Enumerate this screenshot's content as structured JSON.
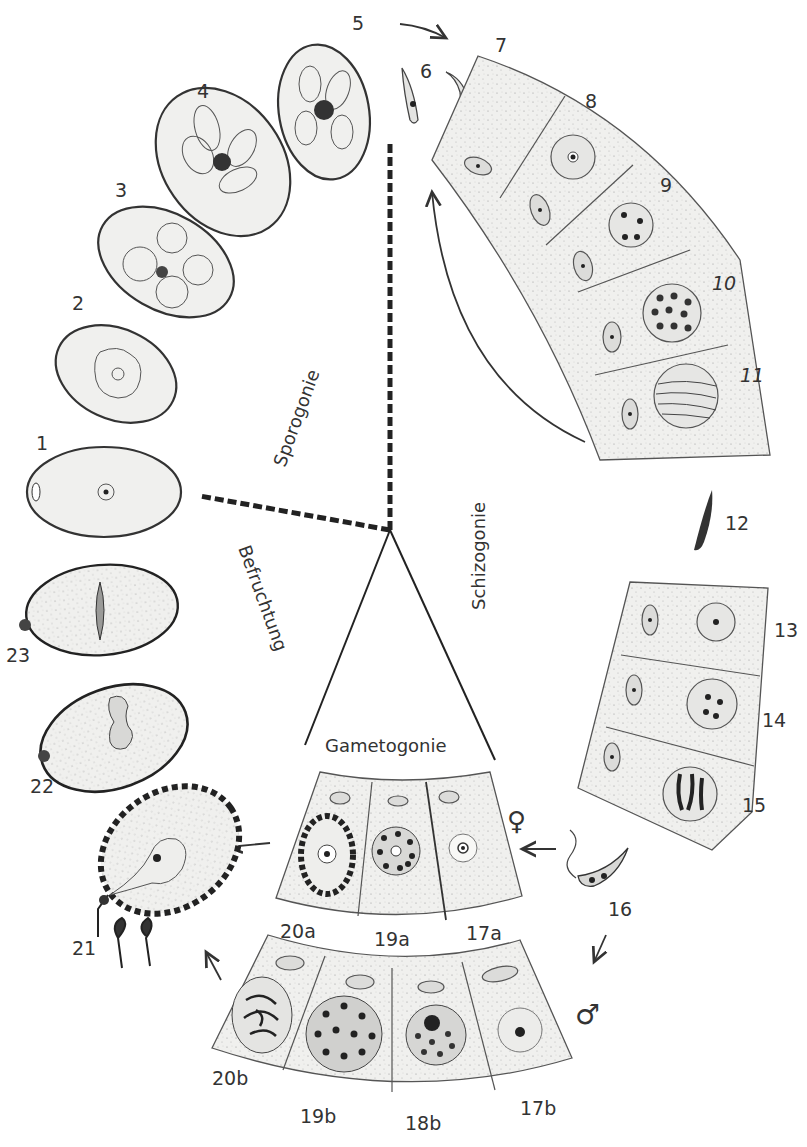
{
  "figure": {
    "phases": {
      "sporogonie": "Sporogonie",
      "schizogonie": "Schizogonie",
      "gametogonie": "Gametogonie",
      "befruchtung": "Befruchtung"
    },
    "stage_labels": {
      "s1": "1",
      "s2": "2",
      "s3": "3",
      "s4": "4",
      "s5": "5",
      "s6": "6",
      "s7": "7",
      "s8": "8",
      "s9": "9",
      "s10": "10",
      "s11": "11",
      "s12": "12",
      "s13": "13",
      "s14": "14",
      "s15": "15",
      "s16": "16",
      "s17a": "17a",
      "s19a": "19a",
      "s20a": "20a",
      "s17b": "17b",
      "s18b": "18b",
      "s19b": "19b",
      "s20b": "20b",
      "s21": "21",
      "s22": "22",
      "s23": "23"
    },
    "symbols": {
      "female": "♀",
      "male": "♂"
    },
    "colors": {
      "ink": "#333333",
      "cell_fill": "#f1f1ef",
      "background": "#ffffff"
    }
  }
}
